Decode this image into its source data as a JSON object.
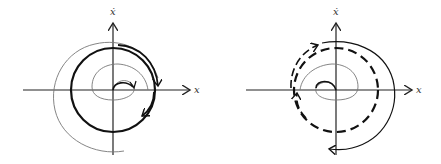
{
  "diagrams": [
    {
      "id": "stable-limit-cycle",
      "x_axis_label": "x",
      "y_axis_label": "ẋ",
      "origin": [
        113,
        90
      ],
      "limit_cycle": {
        "style": "solid-thick",
        "radius": 42
      },
      "trajectories": [
        "inner spiral outward (thin)",
        "outer spiral inward (thin)"
      ],
      "colors": {
        "axis": "#222222",
        "thick": "#111111",
        "thin": "#777777"
      }
    },
    {
      "id": "unstable-limit-cycle",
      "x_axis_label": "x",
      "y_axis_label": "ẋ",
      "origin": [
        336,
        90
      ],
      "limit_cycle": {
        "style": "dashed-thick",
        "radius": 42
      },
      "trajectories": [
        "inner spiral inward (thin)",
        "outer spiral outward (solid)"
      ],
      "colors": {
        "axis": "#222222",
        "thick": "#111111",
        "thin": "#777777"
      }
    }
  ]
}
